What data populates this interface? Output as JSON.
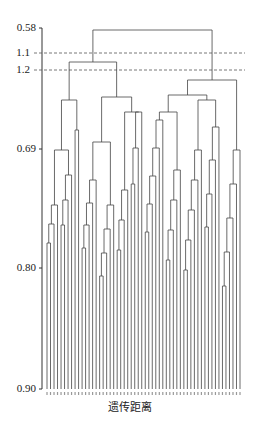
{
  "chart_data": {
    "type": "dendrogram",
    "title": "",
    "xlabel": "遗传距离",
    "ylabel": "",
    "y_ticks": [
      {
        "label": "0.58",
        "value": 0.58
      },
      {
        "label": "1.1",
        "value": 1.1,
        "dashed_line": true
      },
      {
        "label": "1.2",
        "value": 1.2,
        "dashed_line": true
      },
      {
        "label": "0.69",
        "value": 0.69
      },
      {
        "label": "0.80",
        "value": 0.8
      },
      {
        "label": "0.90",
        "value": 0.9
      }
    ],
    "leaf_count": 56,
    "main_clusters": 3,
    "grid": false
  },
  "axis": {
    "tick_0": "0.58",
    "tick_1": "1.1",
    "tick_2": "1.2",
    "tick_3": "0.69",
    "tick_4": "0.80",
    "tick_5": "0.90"
  },
  "labels": {
    "xlabel": "遗传距离"
  }
}
